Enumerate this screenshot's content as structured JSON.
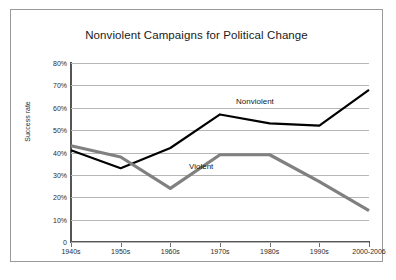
{
  "chart_data": {
    "type": "line",
    "title": "Nonviolent Campaigns for Political Change",
    "xlabel": "",
    "ylabel": "Success rate",
    "categories": [
      "1940s",
      "1950s",
      "1960s",
      "1970s",
      "1980s",
      "1990s",
      "2000-2006"
    ],
    "ylim": [
      0,
      80
    ],
    "yticks": [
      "0",
      "10%",
      "20%",
      "30%",
      "40%",
      "50%",
      "60%",
      "70%",
      "80%"
    ],
    "ytick_values": [
      0,
      10,
      20,
      30,
      40,
      50,
      60,
      70,
      80
    ],
    "grid": true,
    "legend": "inline-annotations",
    "series": [
      {
        "name": "Nonviolent",
        "color": "#000000",
        "values": [
          41,
          33,
          42,
          57,
          53,
          52,
          68
        ]
      },
      {
        "name": "Violent",
        "color": "#808080",
        "values": [
          43,
          38,
          24,
          39,
          39,
          27,
          14
        ]
      }
    ],
    "annotations": [
      {
        "text": "Nonviolent",
        "series": "Nonviolent"
      },
      {
        "text": "Violent",
        "series": "Violent"
      }
    ]
  },
  "frame": {
    "border_color": "#9a9a9a",
    "background": "#ffffff"
  }
}
